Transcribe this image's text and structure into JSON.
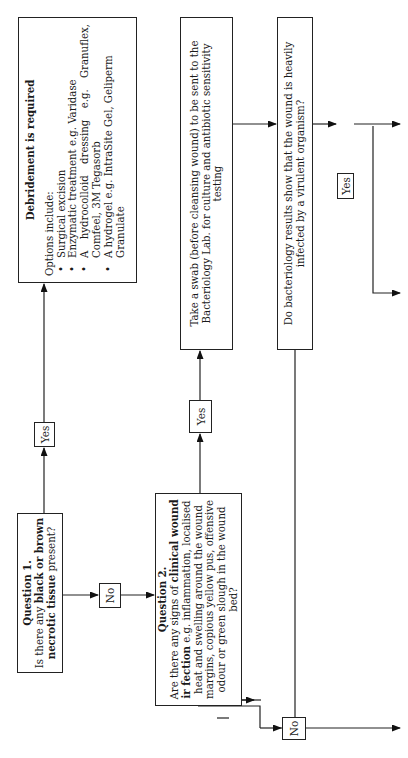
{
  "question1": {
    "title": "Question 1.",
    "text_a": "Is there any ",
    "text_b": "black or brown",
    "text_c": "necrotic tissue",
    "text_d": " present?"
  },
  "question2": {
    "title": "Question 2.",
    "text_a": "Are there any signs of ",
    "text_b": "clinical wound",
    "text_c": "ir fection",
    "text_d": " e.g. inflammation, localised heat and swelling around the wound margins, copious yellow pus, offensive odour or green slough in the wound bed?"
  },
  "debridement": {
    "title": "Debridement is required",
    "intro": "Options include:",
    "options": [
      "Surgical excision",
      "Enzymatic treatment e.g. Varidase",
      "A hydrocolloid dressing e.g. Granuflex, Comfeel, 3M Tegasorb",
      "A hydrogel e.g. IntraSite Gel, Geliperm Granulate"
    ]
  },
  "swab": {
    "text": "Take a swab (before cleansing wound) to be sent to the Bacteriology Lab. for culture and antibiotic sensitivity testing"
  },
  "bacteriology": {
    "text": "Do bacteriology results show that the wound is heavily infected by a virulent organism?"
  },
  "labels": {
    "yes1": "Yes",
    "no1": "No",
    "yes2": "Yes",
    "yes3": "Yes",
    "no2": "No"
  }
}
